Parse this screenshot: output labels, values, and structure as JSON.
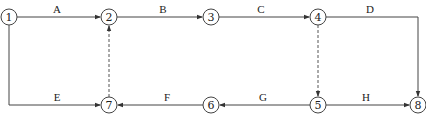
{
  "diagram": {
    "type": "network-diagram",
    "nodes": [
      {
        "id": "1",
        "label": "1",
        "x": 9,
        "y": 17
      },
      {
        "id": "2",
        "label": "2",
        "x": 109,
        "y": 17
      },
      {
        "id": "3",
        "label": "3",
        "x": 211,
        "y": 17
      },
      {
        "id": "4",
        "label": "4",
        "x": 318,
        "y": 17
      },
      {
        "id": "5",
        "label": "5",
        "x": 318,
        "y": 105
      },
      {
        "id": "6",
        "label": "6",
        "x": 211,
        "y": 105
      },
      {
        "id": "7",
        "label": "7",
        "x": 109,
        "y": 105
      },
      {
        "id": "8",
        "label": "8",
        "x": 418,
        "y": 105
      }
    ],
    "edges": [
      {
        "from": "1",
        "to": "2",
        "label": "A",
        "style": "solid"
      },
      {
        "from": "2",
        "to": "3",
        "label": "B",
        "style": "solid"
      },
      {
        "from": "3",
        "to": "4",
        "label": "C",
        "style": "solid"
      },
      {
        "from": "4",
        "to": "8",
        "label": "D",
        "style": "solid"
      },
      {
        "from": "1",
        "to": "7",
        "label": "E",
        "style": "solid"
      },
      {
        "from": "6",
        "to": "7",
        "label": "F",
        "style": "solid"
      },
      {
        "from": "5",
        "to": "6",
        "label": "G",
        "style": "solid"
      },
      {
        "from": "5",
        "to": "8",
        "label": "H",
        "style": "solid"
      },
      {
        "from": "7",
        "to": "2",
        "label": "",
        "style": "dashed"
      },
      {
        "from": "4",
        "to": "5",
        "label": "",
        "style": "dashed"
      }
    ]
  }
}
